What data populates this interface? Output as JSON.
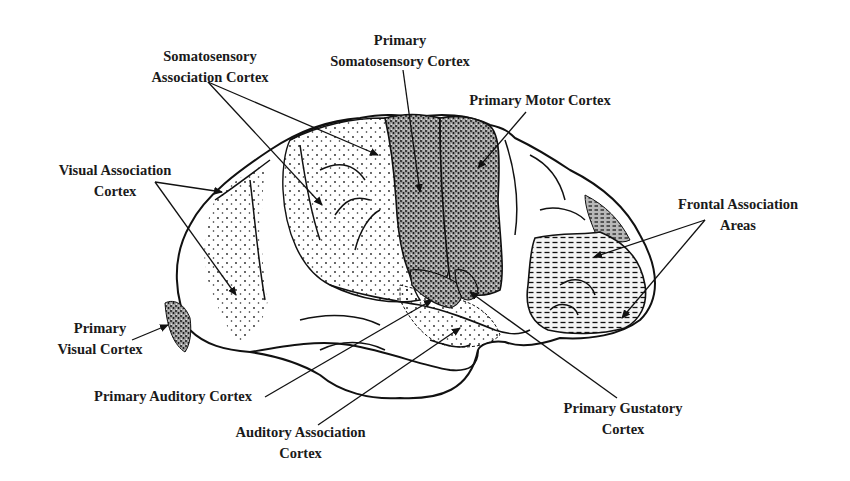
{
  "diagram": {
    "background": "#ffffff",
    "ink": "#1a1a1a",
    "labels": [
      {
        "id": "somatosensory-association",
        "lines": [
          "Somatosensory",
          "Association Cortex"
        ]
      },
      {
        "id": "primary-somatosensory",
        "lines": [
          "Primary",
          "Somatosensory Cortex"
        ]
      },
      {
        "id": "primary-motor",
        "lines": [
          "Primary Motor Cortex"
        ]
      },
      {
        "id": "visual-association",
        "lines": [
          "Visual Association",
          "Cortex"
        ]
      },
      {
        "id": "frontal-association",
        "lines": [
          "Frontal Association",
          "Areas"
        ]
      },
      {
        "id": "primary-visual",
        "lines": [
          "Primary",
          "Visual Cortex"
        ]
      },
      {
        "id": "primary-auditory",
        "lines": [
          "Primary Auditory Cortex"
        ]
      },
      {
        "id": "auditory-association",
        "lines": [
          "Auditory Association",
          "Cortex"
        ]
      },
      {
        "id": "primary-gustatory",
        "lines": [
          "Primary Gustatory",
          "Cortex"
        ]
      }
    ],
    "regions": [
      {
        "name": "primary-somatosensory-cortex",
        "fill": "dense-stipple"
      },
      {
        "name": "primary-motor-cortex",
        "fill": "dense-stipple"
      },
      {
        "name": "somatosensory-association-cortex",
        "fill": "sparse-stipple"
      },
      {
        "name": "visual-association-cortex",
        "fill": "sparse-stipple"
      },
      {
        "name": "primary-visual-cortex",
        "fill": "dense-stipple"
      },
      {
        "name": "frontal-association-areas",
        "fill": "dash-hatch"
      },
      {
        "name": "primary-auditory-cortex",
        "fill": "dense-stipple"
      },
      {
        "name": "auditory-association-cortex",
        "fill": "sparse-stipple"
      },
      {
        "name": "primary-gustatory-cortex",
        "fill": "dense-stipple"
      }
    ]
  }
}
